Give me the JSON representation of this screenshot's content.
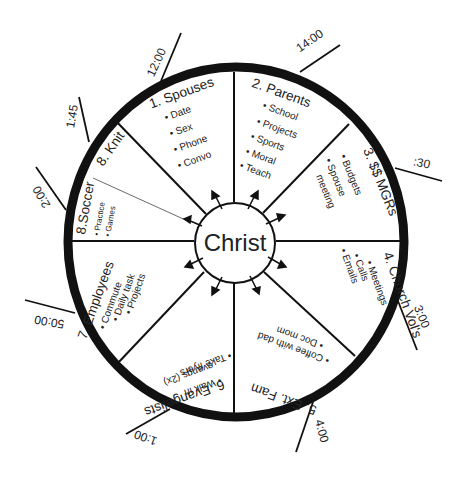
{
  "center": {
    "label": "Christ"
  },
  "segments": [
    {
      "title": "1. Spouses",
      "items": [
        "Date",
        "Sex",
        "Phone",
        "Convo"
      ]
    },
    {
      "title": "2. Parents",
      "items": [
        "School",
        "Projects",
        "Sports",
        "Moral",
        "Teach"
      ]
    },
    {
      "title": "3. $$ MGRs",
      "items": [
        "Budgets",
        "Spouse meeting"
      ]
    },
    {
      "title": "4. Church Vol's",
      "items": [
        "Meetings",
        "Calls",
        "Emails"
      ]
    },
    {
      "title": "5. Ext. Fam",
      "items": [
        "Coffee with dad",
        "Doc mom"
      ]
    },
    {
      "title": "6. Evangelists",
      "items": [
        "Walk in evangs (2x)",
        "Take flyers"
      ]
    },
    {
      "title": "7. Employees",
      "items": [
        "Commute",
        "Daily task",
        "Projects"
      ]
    },
    {
      "title": "8.Soccer",
      "items": [
        "Practice",
        "Games"
      ]
    },
    {
      "title": "8. Knit",
      "items": []
    }
  ],
  "times": [
    "12:00",
    "14:00",
    ":30",
    "3:00",
    "4:00",
    "1:00",
    "50:00",
    "2:00",
    "1:45"
  ],
  "colors": {
    "ink": "#111111",
    "text": "#222222",
    "background": "#ffffff"
  }
}
